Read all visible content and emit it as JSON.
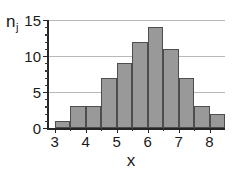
{
  "chart_data": {
    "type": "bar",
    "title": "",
    "subtitle": "",
    "xlabel": "x",
    "ylabel": "n",
    "ylabel_subscript": "j",
    "ylabel_full": "n_j",
    "bin_width": 0.5,
    "bin_starts": [
      3.0,
      3.5,
      4.0,
      4.5,
      5.0,
      5.5,
      6.0,
      6.5,
      7.0,
      7.5,
      8.0
    ],
    "bin_ends": [
      3.5,
      4.0,
      4.5,
      5.0,
      5.5,
      6.0,
      6.5,
      7.0,
      7.5,
      8.0,
      8.5
    ],
    "categories": [
      "3.0-3.5",
      "3.5-4.0",
      "4.0-4.5",
      "4.5-5.0",
      "5.0-5.5",
      "5.5-6.0",
      "6.0-6.5",
      "6.5-7.0",
      "7.0-7.5",
      "7.5-8.0",
      "8.0-8.5"
    ],
    "values": [
      1,
      3,
      3,
      7,
      9,
      12,
      14,
      11,
      7,
      3,
      2
    ],
    "xlim": [
      2.75,
      8.5
    ],
    "ylim": [
      0,
      15
    ],
    "x_ticks_major": [
      3,
      4,
      5,
      6,
      7,
      8
    ],
    "x_tick_labels": [
      "3",
      "4",
      "5",
      "6",
      "7",
      "8"
    ],
    "x_ticks_minor": [
      3.5,
      4.5,
      5.5,
      6.5,
      7.5
    ],
    "y_ticks_major": [
      0,
      5,
      10,
      15
    ],
    "y_tick_labels": [
      "0",
      "5",
      "10",
      "15"
    ],
    "y_ticks_minor": [
      1,
      2,
      3,
      4,
      6,
      7,
      8,
      9,
      11,
      12,
      13,
      14
    ],
    "gridlines_y": [
      5,
      10,
      15
    ],
    "grid": true,
    "legend": null,
    "legend_position": "none",
    "bar_fill_color": "#999999",
    "bar_edge_color": "#4d4d4d",
    "grid_color": "#b9b9b9",
    "axis_color": "#262626",
    "background_color": "#ffffff",
    "text_color": "#1a1a1a"
  }
}
